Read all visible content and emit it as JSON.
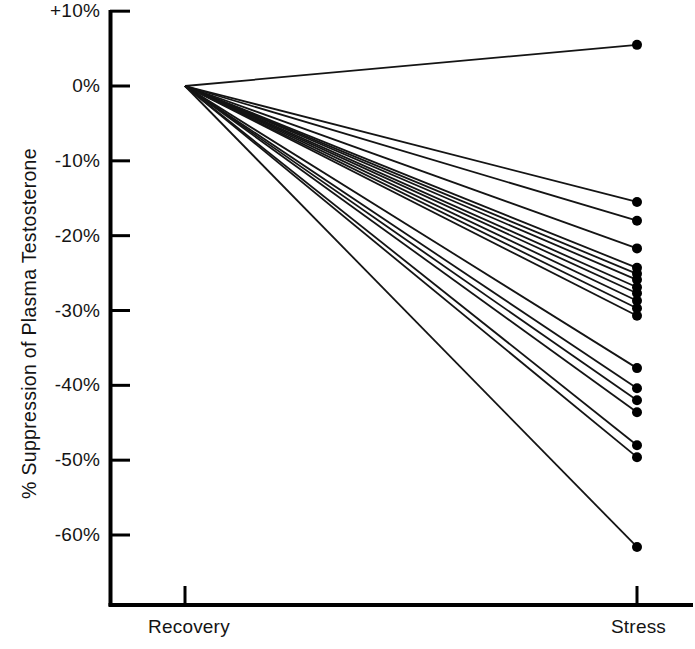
{
  "chart_data": {
    "type": "line",
    "title": "",
    "subtitle": "",
    "xlabel": "",
    "ylabel": "% Suppression of Plasma Testosterone",
    "categories": [
      "Recovery",
      "Stress"
    ],
    "x_tick_labels": [
      "Recovery",
      "Stress"
    ],
    "y_tick_labels": [
      "+10%",
      "0%",
      "-10%",
      "-20%",
      "-30%",
      "-40%",
      "-50%",
      "-60%"
    ],
    "y_tick_values": [
      10,
      0,
      -10,
      -20,
      -30,
      -40,
      -50,
      -60
    ],
    "ylim": [
      -65,
      10
    ],
    "xlim": [
      0,
      1
    ],
    "grid": false,
    "legend": null,
    "legend_position": "none",
    "annotations": [],
    "marker": "filled-circle",
    "marker_at": "stress-only",
    "series": [
      {
        "name": "subject-01",
        "values": [
          0,
          5.5
        ]
      },
      {
        "name": "subject-02",
        "values": [
          0,
          -15.5
        ]
      },
      {
        "name": "subject-03",
        "values": [
          0,
          -18.0
        ]
      },
      {
        "name": "subject-04",
        "values": [
          0,
          -21.7
        ]
      },
      {
        "name": "subject-05",
        "values": [
          0,
          -24.3
        ]
      },
      {
        "name": "subject-06",
        "values": [
          0,
          -25.1
        ]
      },
      {
        "name": "subject-07",
        "values": [
          0,
          -25.9
        ]
      },
      {
        "name": "subject-08",
        "values": [
          0,
          -26.9
        ]
      },
      {
        "name": "subject-09",
        "values": [
          0,
          -27.7
        ]
      },
      {
        "name": "subject-10",
        "values": [
          0,
          -28.7
        ]
      },
      {
        "name": "subject-11",
        "values": [
          0,
          -29.7
        ]
      },
      {
        "name": "subject-12",
        "values": [
          0,
          -30.7
        ]
      },
      {
        "name": "subject-13",
        "values": [
          0,
          -37.7
        ]
      },
      {
        "name": "subject-14",
        "values": [
          0,
          -40.4
        ]
      },
      {
        "name": "subject-15",
        "values": [
          0,
          -42.0
        ]
      },
      {
        "name": "subject-16",
        "values": [
          0,
          -43.6
        ]
      },
      {
        "name": "subject-17",
        "values": [
          0,
          -48.0
        ]
      },
      {
        "name": "subject-18",
        "values": [
          0,
          -49.6
        ]
      },
      {
        "name": "subject-19",
        "values": [
          0,
          -61.6
        ]
      }
    ],
    "colors": {
      "line": "#141414",
      "marker": "#000000",
      "axis": "#000000",
      "background": "#ffffff",
      "text": "#141414"
    }
  }
}
